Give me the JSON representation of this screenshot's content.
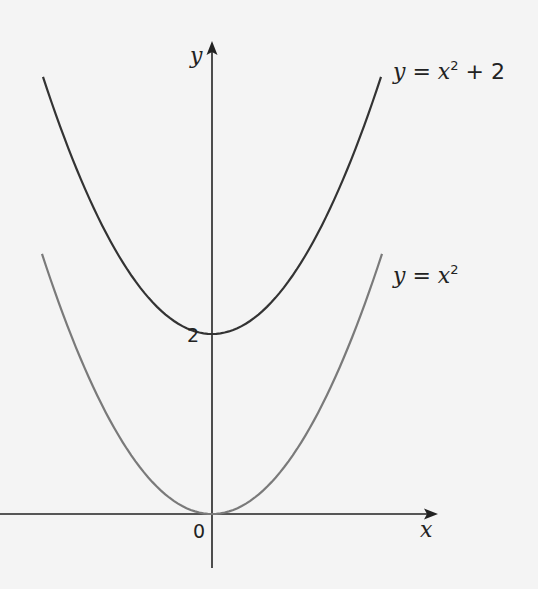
{
  "chart_data": {
    "type": "line",
    "title": "",
    "xlabel": "x",
    "ylabel": "y",
    "origin_label": "0",
    "y_tick_labels": [
      {
        "value": 2,
        "label": "2"
      }
    ],
    "xlim": [
      -2.12,
      2.25
    ],
    "ylim": [
      -0.6,
      5.3
    ],
    "grid": false,
    "legend": "inline labels at right end of curves",
    "series": [
      {
        "name": "y = x² + 2",
        "label_parts": {
          "y": "y",
          "eq": " = ",
          "x": "x",
          "sup": "2",
          "rest": " + 2"
        },
        "color": "#333333",
        "x": [
          -1.71,
          -1.5,
          -1.0,
          -0.5,
          0,
          0.5,
          1.0,
          1.5,
          1.71
        ],
        "y": [
          4.92,
          4.25,
          3.0,
          2.25,
          2.0,
          2.25,
          3.0,
          4.25,
          4.92
        ]
      },
      {
        "name": "y = x²",
        "label_parts": {
          "y": "y",
          "eq": " = ",
          "x": "x",
          "sup": "2",
          "rest": ""
        },
        "color": "#7a7a7a",
        "x": [
          -1.71,
          -1.5,
          -1.0,
          -0.5,
          0,
          0.5,
          1.0,
          1.5,
          1.71
        ],
        "y": [
          2.92,
          2.25,
          1.0,
          0.25,
          0.0,
          0.25,
          1.0,
          2.25,
          2.92
        ]
      }
    ]
  },
  "colors": {
    "background": "#f4f4f4",
    "axis": "#222222",
    "upper_curve": "#333333",
    "lower_curve": "#7a7a7a",
    "text": "#222222"
  }
}
